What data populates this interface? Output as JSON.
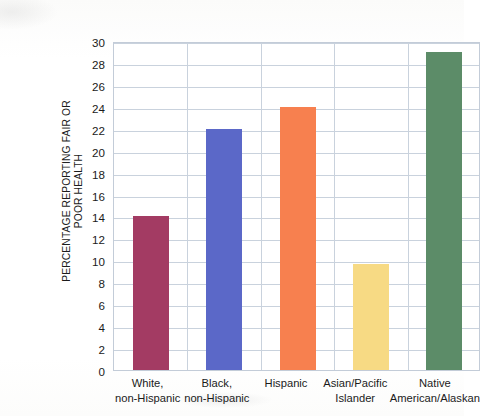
{
  "chart_data": {
    "type": "bar",
    "title": "",
    "xlabel": "",
    "ylabel": "PERCENTAGE REPORTING FAIR OR POOR HEALTH",
    "ylabel_lines": [
      "PERCENTAGE REPORTING FAIR OR",
      "POOR HEALTH"
    ],
    "categories": [
      "White, non-Hispanic",
      "Black, non-Hispanic",
      "Hispanic",
      "Asian/Pacific Islander",
      "Native American/Alaskan"
    ],
    "category_lines": [
      [
        "White,",
        "non-Hispanic"
      ],
      [
        "Black,",
        "non-Hispanic"
      ],
      [
        "Hispanic"
      ],
      [
        "Asian/Pacific",
        "Islander"
      ],
      [
        "Native",
        "American/Alaskan"
      ]
    ],
    "values": [
      14,
      22,
      24,
      9.7,
      29
    ],
    "bar_colors": [
      "#a33b63",
      "#5b68c8",
      "#f7804f",
      "#f7da84",
      "#5c8c68"
    ],
    "ylim": [
      0,
      30
    ],
    "y_ticks": [
      0,
      2,
      4,
      6,
      8,
      10,
      12,
      14,
      16,
      18,
      20,
      22,
      24,
      26,
      28,
      30
    ],
    "y_tick_labels": [
      "0",
      "2",
      "4",
      "6",
      "8",
      "10",
      "12",
      "14",
      "16",
      "18",
      "20",
      "22",
      "24",
      "26",
      "28",
      "30"
    ],
    "grid": true,
    "grid_color": "#c9d2dd",
    "legend": null,
    "legend_position": "none"
  }
}
